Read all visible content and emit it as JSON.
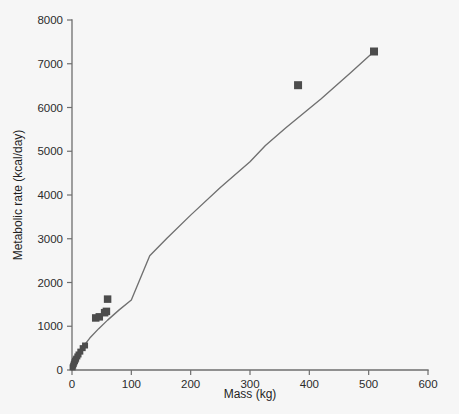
{
  "chart_data": {
    "type": "scatter",
    "title": "",
    "subtitle": "",
    "xlabel": "Mass (kg)",
    "ylabel": "Metabolic rate (kcal/day)",
    "xlim": [
      0,
      600
    ],
    "ylim": [
      0,
      8000
    ],
    "xticks": [
      0,
      100,
      200,
      300,
      400,
      500,
      600
    ],
    "yticks": [
      0,
      1000,
      2000,
      3000,
      4000,
      5000,
      6000,
      7000,
      8000
    ],
    "xtick_labels": [
      "0",
      "100",
      "200",
      "300",
      "400",
      "500",
      "600"
    ],
    "ytick_labels": [
      "0",
      "1000",
      "2000",
      "3000",
      "4000",
      "5000",
      "6000",
      "7000",
      "8000"
    ],
    "grid": false,
    "legend": null,
    "legend_position": "none",
    "annotations": [],
    "marker_color": "#4c4c4c",
    "marker_shape": "square",
    "line_color": "#707070",
    "background_color": "#f6f6f6",
    "axis_color": "#6e6e6e",
    "series": [
      {
        "name": "Observed animals",
        "type": "scatter",
        "marker": "square",
        "color": "#4c4c4c",
        "points": [
          {
            "x": 1,
            "y": 60
          },
          {
            "x": 2,
            "y": 100
          },
          {
            "x": 3,
            "y": 140
          },
          {
            "x": 4,
            "y": 175
          },
          {
            "x": 5,
            "y": 205
          },
          {
            "x": 6,
            "y": 235
          },
          {
            "x": 7,
            "y": 260
          },
          {
            "x": 9,
            "y": 310
          },
          {
            "x": 11,
            "y": 355
          },
          {
            "x": 14,
            "y": 420
          },
          {
            "x": 18,
            "y": 500
          },
          {
            "x": 22,
            "y": 560
          },
          {
            "x": 40,
            "y": 1190
          },
          {
            "x": 46,
            "y": 1215
          },
          {
            "x": 55,
            "y": 1310
          },
          {
            "x": 58,
            "y": 1340
          },
          {
            "x": 60,
            "y": 1620
          },
          {
            "x": 381,
            "y": 6510
          },
          {
            "x": 509,
            "y": 7280
          }
        ]
      },
      {
        "name": "Allometric fit",
        "type": "line",
        "color": "#707070",
        "curve_points": [
          {
            "x": 0,
            "y": 0
          },
          {
            "x": 5,
            "y": 215
          },
          {
            "x": 10,
            "y": 350
          },
          {
            "x": 20,
            "y": 555
          },
          {
            "x": 30,
            "y": 730
          },
          {
            "x": 45,
            "y": 945
          },
          {
            "x": 60,
            "y": 1140
          },
          {
            "x": 80,
            "y": 1380
          },
          {
            "x": 100,
            "y": 1600
          },
          {
            "x": 131,
            "y": 2610
          },
          {
            "x": 160,
            "y": 3010
          },
          {
            "x": 200,
            "y": 3540
          },
          {
            "x": 250,
            "y": 4170
          },
          {
            "x": 300,
            "y": 4760
          },
          {
            "x": 326,
            "y": 5130
          },
          {
            "x": 360,
            "y": 5530
          },
          {
            "x": 420,
            "y": 6200
          },
          {
            "x": 470,
            "y": 6800
          },
          {
            "x": 509,
            "y": 7280
          }
        ]
      }
    ]
  }
}
